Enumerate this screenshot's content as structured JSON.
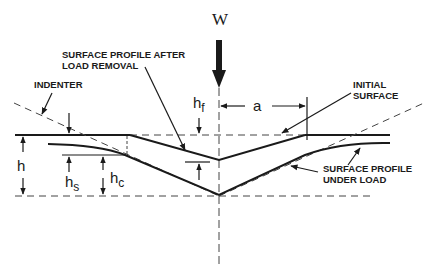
{
  "diagram": {
    "load_label": "W",
    "labels": {
      "after_removal_line1": "SURFACE PROFILE AFTER",
      "after_removal_line2": "LOAD REMOVAL",
      "indenter": "INDENTER",
      "initial_line1": "INITIAL",
      "initial_line2": "SURFACE",
      "under_load_line1": "SURFACE PROFILE",
      "under_load_line2": "UNDER LOAD"
    },
    "symbols": {
      "h": "h",
      "hf_base": "h",
      "hf_sub": "f",
      "hs_base": "h",
      "hs_sub": "s",
      "hc_base": "h",
      "hc_sub": "c",
      "a": "a"
    },
    "colors": {
      "line": "#1a1a1a",
      "background": "#ffffff"
    }
  }
}
